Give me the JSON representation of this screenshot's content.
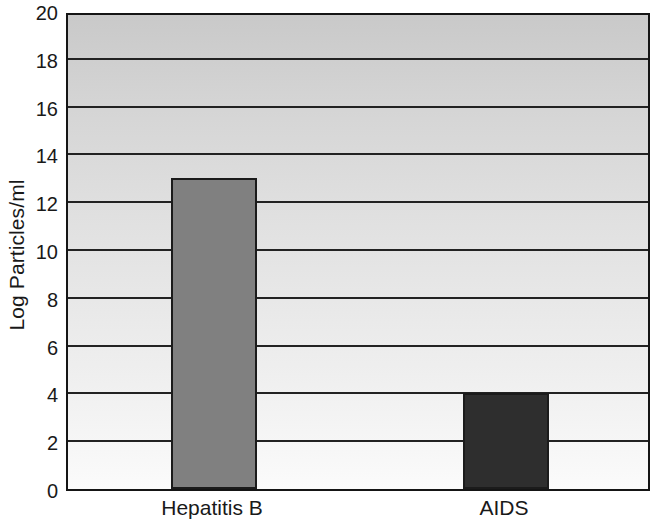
{
  "chart_data": {
    "type": "bar",
    "title": "",
    "subtitle": "",
    "xlabel": "",
    "ylabel": "Log Particles/ml",
    "categories": [
      "Hepatitis B",
      "AIDS"
    ],
    "values": [
      13,
      4
    ],
    "series": [
      {
        "name": "Log Particles/ml",
        "values": [
          13,
          4
        ]
      }
    ],
    "ylim": [
      0,
      20
    ],
    "ytick_step": 2,
    "ytick_labels": [
      "0",
      "2",
      "4",
      "6",
      "8",
      "10",
      "12",
      "14",
      "16",
      "18",
      "20"
    ],
    "ytick_values": [
      0,
      2,
      4,
      6,
      8,
      10,
      12,
      14,
      16,
      18,
      20
    ],
    "gridlines": true,
    "gridline_values": [
      2,
      4,
      6,
      8,
      10,
      12,
      14,
      16,
      18
    ],
    "grid_axis": "y",
    "legend": false,
    "legend_position": "none",
    "annotations": [],
    "bar_colors": [
      "#808080",
      "#2e2e2e"
    ],
    "bar_border_color": "#1b1b1b",
    "plot_border_color": "#151515",
    "gridline_color": "#222222",
    "text_color": "#191919",
    "plot_background_top_color": "#c9c9c9",
    "plot_background_bottom_color": "#fbfbfb",
    "bars": [
      {
        "category": "Hepatitis B",
        "value": 13,
        "color": "#808080"
      },
      {
        "category": "AIDS",
        "value": 4,
        "color": "#2e2e2e"
      }
    ]
  }
}
